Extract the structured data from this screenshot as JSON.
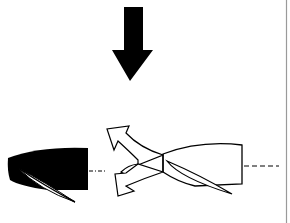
{
  "diagram": {
    "colors": {
      "ink": "#000000",
      "paper": "#ffffff",
      "border": "#9a9a9a"
    },
    "elements": [
      "down-arrow",
      "black-nacelle",
      "three-way-flow-arrow",
      "white-nacelle",
      "centerline-dashes"
    ]
  }
}
